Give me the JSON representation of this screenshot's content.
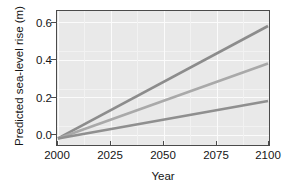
{
  "chart_data": {
    "type": "line",
    "title": "",
    "xlabel": "Year",
    "ylabel": "Predicted sea-level rise (m)",
    "xlim": [
      2000,
      2100
    ],
    "ylim": [
      -0.035,
      0.68
    ],
    "xticks": [
      2000,
      2025,
      2050,
      2075,
      2100
    ],
    "xtick_labels": [
      "2000",
      "2025",
      "2050",
      "2075",
      "2100"
    ],
    "yticks": [
      0.0,
      0.2,
      0.4,
      0.6
    ],
    "ytick_labels": [
      "0.0",
      "0.2",
      "0.4",
      "0.6"
    ],
    "grid": true,
    "legend": "none",
    "panel_background": "#e9e9e9",
    "gridline_color": "#fbfbfb",
    "x": [
      2000,
      2100
    ],
    "series": [
      {
        "name": "high",
        "color": "#8c8c8c",
        "values": [
          0.0,
          0.6
        ]
      },
      {
        "name": "medium",
        "color": "#a9a9a9",
        "values": [
          0.0,
          0.4
        ]
      },
      {
        "name": "low",
        "color": "#8f8f8f",
        "values": [
          0.0,
          0.2
        ]
      }
    ]
  },
  "axis": {
    "y_title": "Predicted sea-level rise (m)",
    "x_title": "Year",
    "y_labels": [
      "0.6",
      "0.4",
      "0.2",
      "0.0"
    ],
    "x_labels": [
      "2000",
      "2025",
      "2050",
      "2075",
      "2100"
    ]
  }
}
